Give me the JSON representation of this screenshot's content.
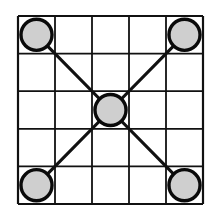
{
  "diagram": {
    "type": "board-grid",
    "rows": 5,
    "cols": 5,
    "grid": {
      "x": 18,
      "y": 16,
      "width": 185,
      "height": 188
    },
    "colors": {
      "background": "#ffffff",
      "line": "#111111",
      "piece_fill": "#cfcfcf",
      "piece_stroke": "#0a0a0a"
    },
    "pieces": [
      {
        "name": "top-left",
        "row": 0,
        "col": 0
      },
      {
        "name": "top-right",
        "row": 0,
        "col": 4
      },
      {
        "name": "center",
        "row": 2,
        "col": 2
      },
      {
        "name": "bottom-left",
        "row": 4,
        "col": 0
      },
      {
        "name": "bottom-right",
        "row": 4,
        "col": 4
      }
    ],
    "connections": [
      [
        "top-left",
        "center"
      ],
      [
        "top-right",
        "center"
      ],
      [
        "bottom-left",
        "center"
      ],
      [
        "bottom-right",
        "center"
      ]
    ]
  }
}
